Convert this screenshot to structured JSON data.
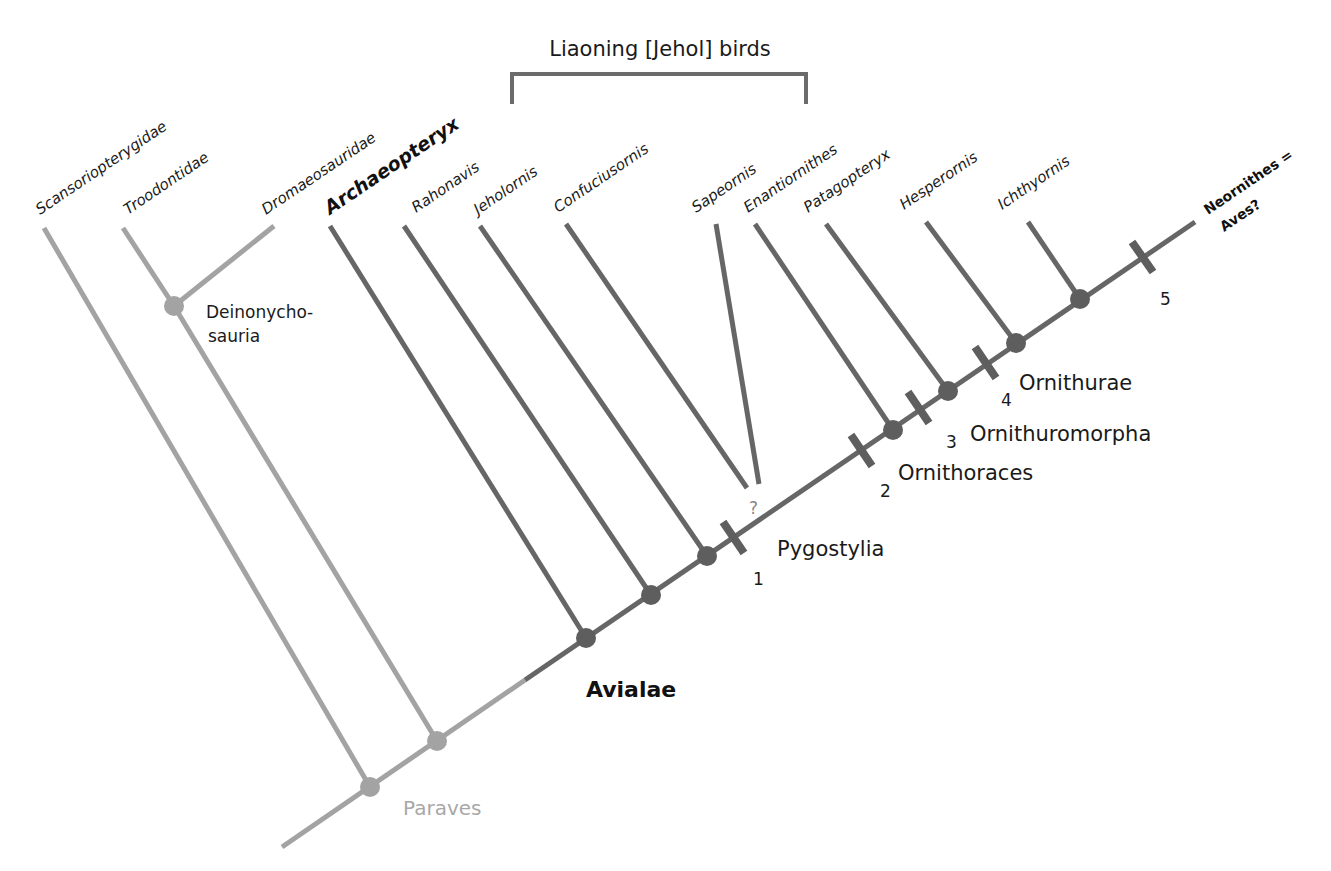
{
  "diagram": {
    "type": "cladogram",
    "colors": {
      "basal_line": "#a3a3a3",
      "avian_line": "#666666",
      "node_basal": "#a3a3a3",
      "node_avian": "#5e5e5e",
      "text": "#1a1a1a",
      "paraves_text": "#a8a8a8"
    },
    "bracket": {
      "label": "Liaoning [Jehol] birds"
    },
    "taxa": [
      {
        "name": "Scansoriopterygidae"
      },
      {
        "name": "Troodontidae"
      },
      {
        "name": "Dromaeosauridae"
      },
      {
        "name": "Archaeopteryx"
      },
      {
        "name": "Rahonavis"
      },
      {
        "name": "Jeholornis"
      },
      {
        "name": "Confuciusornis"
      },
      {
        "name": "Sapeornis"
      },
      {
        "name": "Enantiornithes"
      },
      {
        "name": "Patagopteryx"
      },
      {
        "name": "Hesperornis"
      },
      {
        "name": "Ichthyornis"
      }
    ],
    "crown": {
      "line1": "Neornithes =",
      "line2": "Aves?"
    },
    "clades": {
      "deinonychosauria_line1": "Deinonycho-",
      "deinonychosauria_line2": "sauria",
      "paraves": "Paraves",
      "avialae": "Avialae",
      "pygostylia": "Pygostylia",
      "ornithoraces": "Ornithoraces",
      "ornithuromorpha": "Ornithuromorpha",
      "ornithurae": "Ornithurae"
    },
    "markers": [
      {
        "number": "1"
      },
      {
        "number": "2"
      },
      {
        "number": "3"
      },
      {
        "number": "4"
      },
      {
        "number": "5"
      }
    ],
    "uncertain_mark": "?"
  }
}
